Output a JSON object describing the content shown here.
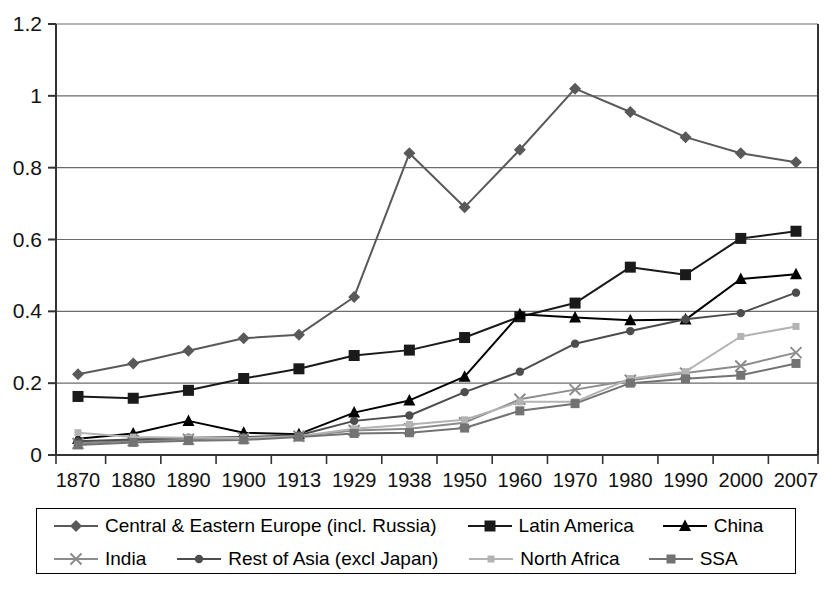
{
  "chart_data": {
    "type": "line",
    "title": "",
    "subtitle": "",
    "xlabel": "",
    "ylabel": "",
    "grid": true,
    "legend_position": "bottom",
    "xlim_categories": true,
    "ylim": [
      0,
      1.2
    ],
    "ytick_step": 0.2,
    "ytick_labels": [
      "1.2",
      "1",
      "0.8",
      "0.6",
      "0.4",
      "0.2",
      "0"
    ],
    "ytick_values": [
      1.2,
      1.0,
      0.8,
      0.6,
      0.4,
      0.2,
      0
    ],
    "categories": [
      "1870",
      "1880",
      "1890",
      "1900",
      "1913",
      "1929",
      "1938",
      "1950",
      "1960",
      "1970",
      "1980",
      "1990",
      "2000",
      "2007"
    ],
    "series": [
      {
        "name": "Central & Eastern Europe (incl. Russia)",
        "marker": "diamond",
        "color": "#595959",
        "values": [
          0.225,
          0.255,
          0.29,
          0.325,
          0.335,
          0.44,
          0.84,
          0.69,
          0.85,
          1.02,
          0.955,
          0.885,
          0.84,
          0.815
        ]
      },
      {
        "name": "Latin America",
        "marker": "square",
        "color": "#1a1a1a",
        "values": [
          0.163,
          0.158,
          0.18,
          0.213,
          0.24,
          0.277,
          0.292,
          0.327,
          0.385,
          0.423,
          0.523,
          0.502,
          0.603,
          0.623
        ]
      },
      {
        "name": "China",
        "marker": "triangle",
        "color": "#000000",
        "values": [
          0.045,
          0.06,
          0.095,
          0.062,
          0.058,
          0.118,
          0.152,
          0.218,
          0.392,
          0.383,
          0.375,
          0.377,
          0.49,
          0.503
        ]
      },
      {
        "name": "India",
        "marker": "x",
        "color": "#8c8c8c",
        "values": [
          0.032,
          0.04,
          0.044,
          0.047,
          0.052,
          0.068,
          0.073,
          0.09,
          0.155,
          0.182,
          0.208,
          0.228,
          0.248,
          0.285
        ]
      },
      {
        "name": "Rest of Asia (excl Japan)",
        "marker": "circle",
        "color": "#4d4d4d",
        "values": [
          0.038,
          0.043,
          0.048,
          0.05,
          0.055,
          0.095,
          0.11,
          0.175,
          0.232,
          0.31,
          0.345,
          0.378,
          0.395,
          0.452
        ]
      },
      {
        "name": "North Africa",
        "marker": "small-square",
        "color": "#b3b3b3",
        "values": [
          0.062,
          0.05,
          0.048,
          0.047,
          0.052,
          0.073,
          0.085,
          0.098,
          0.148,
          0.148,
          0.213,
          0.232,
          0.33,
          0.358
        ]
      },
      {
        "name": "SSA",
        "marker": "square-gray",
        "color": "#737373",
        "values": [
          0.028,
          0.035,
          0.04,
          0.042,
          0.05,
          0.06,
          0.062,
          0.075,
          0.123,
          0.143,
          0.2,
          0.212,
          0.222,
          0.255
        ]
      }
    ],
    "legend_rows": [
      [
        "Central & Eastern Europe (incl. Russia)",
        "Latin America",
        "China"
      ],
      [
        "India",
        "Rest of Asia (excl Japan)",
        "North Africa",
        "SSA"
      ]
    ]
  }
}
